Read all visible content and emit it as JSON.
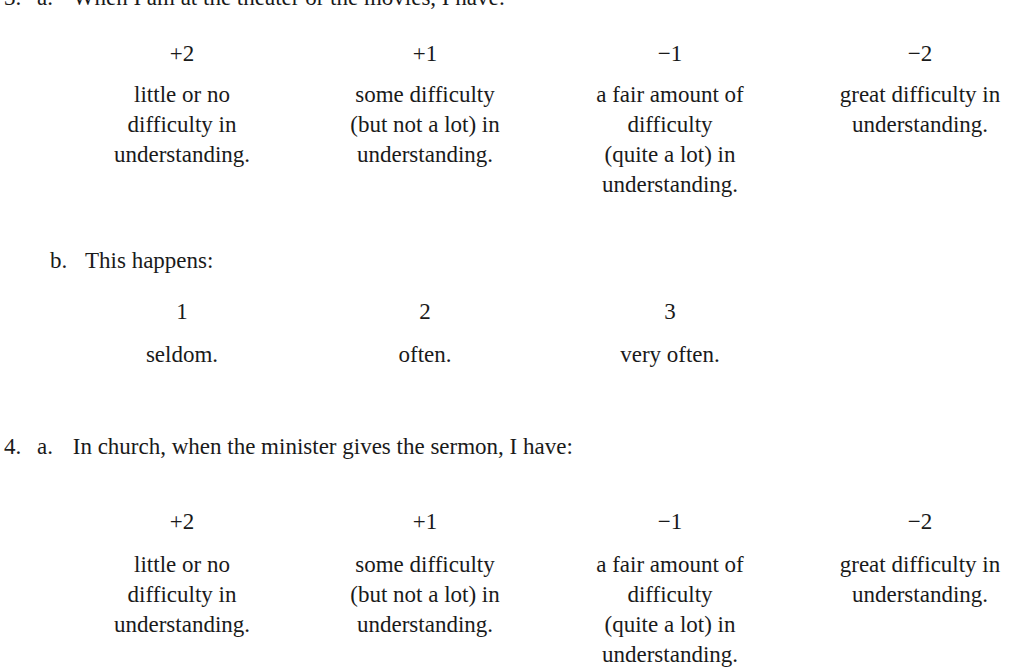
{
  "items": [
    {
      "number": "3.",
      "a_label": "a.",
      "a_text": "When I am at the theater or the movies, I have:",
      "scale": [
        {
          "score": "+2",
          "desc": [
            "little or no",
            "difficulty in",
            "understanding."
          ]
        },
        {
          "score": "+1",
          "desc": [
            "some difficulty",
            "(but not a lot) in",
            "understanding."
          ]
        },
        {
          "score": "−1",
          "desc": [
            "a fair amount of",
            "difficulty",
            "(quite a lot) in",
            "understanding."
          ]
        },
        {
          "score": "−2",
          "desc": [
            "great difficulty in",
            "understanding."
          ]
        }
      ],
      "b_label": "b.",
      "b_text": "This happens:",
      "frequency": [
        {
          "value": "1",
          "label": "seldom."
        },
        {
          "value": "2",
          "label": "often."
        },
        {
          "value": "3",
          "label": "very often."
        }
      ]
    },
    {
      "number": "4.",
      "a_label": "a.",
      "a_text": "In church, when the minister gives the sermon, I have:",
      "scale": [
        {
          "score": "+2",
          "desc": [
            "little or no",
            "difficulty in",
            "understanding."
          ]
        },
        {
          "score": "+1",
          "desc": [
            "some difficulty",
            "(but not a lot) in",
            "understanding."
          ]
        },
        {
          "score": "−1",
          "desc": [
            "a fair amount of",
            "difficulty",
            "(quite a lot) in",
            "understanding."
          ]
        },
        {
          "score": "−2",
          "desc": [
            "great difficulty in",
            "understanding."
          ]
        }
      ]
    }
  ]
}
